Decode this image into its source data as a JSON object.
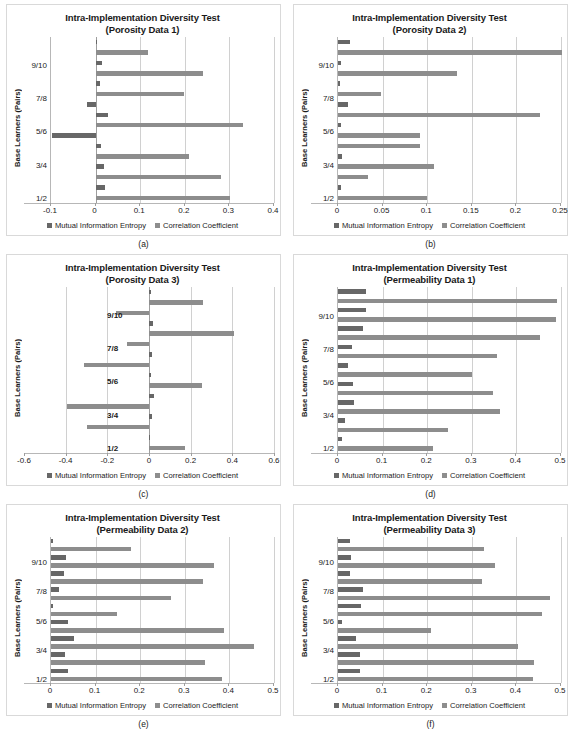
{
  "figure": {
    "legend": {
      "series1_label": "Mutual Information Entropy",
      "series2_label": "Correlation Coefficient",
      "series1_color": "#676767",
      "series2_color": "#8d8d8d"
    },
    "y_axis_title": "Base Learners (Pairs)",
    "captions": [
      "(a)",
      "(b)",
      "(c)",
      "(d)",
      "(e)",
      "(f)"
    ]
  },
  "chart_data": [
    {
      "type": "bar",
      "orientation": "horizontal",
      "panel": "a",
      "caption": "(a)",
      "title": "Intra-Implementation Diversity Test",
      "subtitle": "(Porosity Data 1)",
      "xlabel": "",
      "ylabel": "Base Learners (Pairs)",
      "categories": [
        "1/2",
        "3/4",
        "5/6",
        "7/8",
        "9/10"
      ],
      "category_label_position": "left",
      "xlim": [
        -0.1,
        0.4
      ],
      "xticks": [
        -0.1,
        0,
        0.1,
        0.2,
        0.3,
        0.4
      ],
      "xticklabels": [
        "-0.1",
        "0",
        "0.1",
        "0.2",
        "0.3",
        "0.4"
      ],
      "grid": true,
      "legend_position": "bottom",
      "series": [
        {
          "name": "Mutual Information Entropy",
          "values": [
            0.022,
            0.018,
            0.012,
            0.027,
            -0.1,
            0.008,
            -0.018,
            0.01,
            0.014,
            0.003
          ]
        },
        {
          "name": "Correlation Coefficient",
          "values": [
            0.302,
            0.282,
            0.209,
            0.331,
            0.005,
            0.199,
            0.0,
            0.241,
            0.118,
            0.0
          ]
        }
      ],
      "bars": [
        {
          "category": "1/2",
          "series": "Correlation Coefficient",
          "value": 0.302
        },
        {
          "category": "1/2",
          "series": "Mutual Information Entropy",
          "value": 0.022
        },
        {
          "category": "1/2b",
          "series": "Correlation Coefficient",
          "value": 0.282
        },
        {
          "category": "1/2b",
          "series": "Mutual Information Entropy",
          "value": 0.018
        },
        {
          "category": "3/4",
          "series": "Correlation Coefficient",
          "value": 0.209
        },
        {
          "category": "3/4",
          "series": "Mutual Information Entropy",
          "value": 0.012
        },
        {
          "category": "3/4b",
          "series": "Mutual Information Entropy",
          "value": -0.098
        },
        {
          "category": "5/6",
          "series": "Correlation Coefficient",
          "value": 0.331
        },
        {
          "category": "5/6",
          "series": "Mutual Information Entropy",
          "value": 0.027
        },
        {
          "category": "5/6b",
          "series": "Mutual Information Entropy",
          "value": -0.019
        },
        {
          "category": "7/8",
          "series": "Correlation Coefficient",
          "value": 0.199
        },
        {
          "category": "7/8",
          "series": "Mutual Information Entropy",
          "value": 0.01
        },
        {
          "category": "7/8b",
          "series": "Correlation Coefficient",
          "value": 0.241
        },
        {
          "category": "7/8b",
          "series": "Mutual Information Entropy",
          "value": 0.014
        },
        {
          "category": "9/10",
          "series": "Correlation Coefficient",
          "value": 0.118
        },
        {
          "category": "9/10",
          "series": "Mutual Information Entropy",
          "value": 0.004
        }
      ]
    },
    {
      "type": "bar",
      "orientation": "horizontal",
      "panel": "b",
      "caption": "(b)",
      "title": "Intra-Implementation Diversity Test",
      "subtitle": "(Porosity Data 2)",
      "xlabel": "",
      "ylabel": "Base Learners (Pairs)",
      "categories": [
        "1/2",
        "3/4",
        "5/6",
        "7/8",
        "9/10"
      ],
      "category_label_position": "left",
      "xlim": [
        0,
        0.25
      ],
      "xticks": [
        0,
        0.05,
        0.1,
        0.15,
        0.2,
        0.25
      ],
      "xticklabels": [
        "0",
        "0.05",
        "0.1",
        "0.15",
        "0.2",
        "0.25"
      ],
      "grid": true,
      "legend_position": "bottom",
      "bars": [
        {
          "category": "1/2",
          "series": "Correlation Coefficient",
          "value": 0.1
        },
        {
          "category": "1/2",
          "series": "Mutual Information Entropy",
          "value": 0.003
        },
        {
          "category": "1/2b",
          "series": "Correlation Coefficient",
          "value": 0.034
        },
        {
          "category": "3/4",
          "series": "Correlation Coefficient",
          "value": 0.108
        },
        {
          "category": "3/4",
          "series": "Mutual Information Entropy",
          "value": 0.004
        },
        {
          "category": "3/4b",
          "series": "Correlation Coefficient",
          "value": 0.092
        },
        {
          "category": "5/6",
          "series": "Correlation Coefficient",
          "value": 0.092
        },
        {
          "category": "5/6",
          "series": "Mutual Information Entropy",
          "value": 0.003
        },
        {
          "category": "5/6b",
          "series": "Correlation Coefficient",
          "value": 0.227
        },
        {
          "category": "5/6b",
          "series": "Mutual Information Entropy",
          "value": 0.011
        },
        {
          "category": "7/8",
          "series": "Correlation Coefficient",
          "value": 0.048
        },
        {
          "category": "7/8",
          "series": "Mutual Information Entropy",
          "value": 0.002
        },
        {
          "category": "7/8b",
          "series": "Correlation Coefficient",
          "value": 0.133
        },
        {
          "category": "7/8b",
          "series": "Mutual Information Entropy",
          "value": 0.003
        },
        {
          "category": "9/10",
          "series": "Correlation Coefficient",
          "value": 0.251
        },
        {
          "category": "9/10",
          "series": "Mutual Information Entropy",
          "value": 0.014
        }
      ]
    },
    {
      "type": "bar",
      "orientation": "horizontal",
      "panel": "c",
      "caption": "(c)",
      "title": "Intra-Implementation Diversity Test",
      "subtitle": "(Porosity Data 3)",
      "xlabel": "",
      "ylabel": "Base Learners (Pairs)",
      "categories": [
        "1/2",
        "3/4",
        "5/6",
        "7/8",
        "9/10"
      ],
      "category_label_position": "inside",
      "xlim": [
        -0.6,
        0.6
      ],
      "xticks": [
        -0.6,
        -0.4,
        -0.2,
        0,
        0.2,
        0.4,
        0.6
      ],
      "xticklabels": [
        "-0.6",
        "-0.4",
        "-0.2",
        "0",
        "0.2",
        "0.4",
        "0.6"
      ],
      "grid": true,
      "legend_position": "bottom",
      "bars": [
        {
          "category": "1/2",
          "series": "Correlation Coefficient",
          "value": 0.175
        },
        {
          "category": "1/2",
          "series": "Mutual Information Entropy",
          "value": 0.006
        },
        {
          "category": "1/2b",
          "series": "Correlation Coefficient",
          "value": -0.296
        },
        {
          "category": "1/2b",
          "series": "Mutual Information Entropy",
          "value": 0.012
        },
        {
          "category": "3/4",
          "series": "Correlation Coefficient",
          "value": -0.395
        },
        {
          "category": "3/4",
          "series": "Mutual Information Entropy",
          "value": 0.022
        },
        {
          "category": "3/4b",
          "series": "Correlation Coefficient",
          "value": 0.252
        },
        {
          "category": "3/4b",
          "series": "Mutual Information Entropy",
          "value": 0.01
        },
        {
          "category": "5/6",
          "series": "Correlation Coefficient",
          "value": -0.313
        },
        {
          "category": "5/6",
          "series": "Mutual Information Entropy",
          "value": 0.013
        },
        {
          "category": "5/6b",
          "series": "Correlation Coefficient",
          "value": -0.108
        },
        {
          "category": "7/8",
          "series": "Correlation Coefficient",
          "value": 0.41
        },
        {
          "category": "7/8",
          "series": "Mutual Information Entropy",
          "value": 0.021
        },
        {
          "category": "7/8b",
          "series": "Correlation Coefficient",
          "value": -0.158
        },
        {
          "category": "9/10",
          "series": "Correlation Coefficient",
          "value": 0.258
        },
        {
          "category": "9/10",
          "series": "Mutual Information Entropy",
          "value": 0.008
        }
      ]
    },
    {
      "type": "bar",
      "orientation": "horizontal",
      "panel": "d",
      "caption": "(d)",
      "title": "Intra-Implementation Diversity Test",
      "subtitle": "(Permeability Data 1)",
      "xlabel": "",
      "ylabel": "Base Learners (Pairs)",
      "categories": [
        "1/2",
        "3/4",
        "5/6",
        "7/8",
        "9/10"
      ],
      "category_label_position": "left",
      "xlim": [
        0,
        0.5
      ],
      "xticks": [
        0,
        0.1,
        0.2,
        0.3,
        0.4,
        0.5
      ],
      "xticklabels": [
        "0",
        "0.1",
        "0.2",
        "0.3",
        "0.4",
        "0.5"
      ],
      "grid": true,
      "legend_position": "bottom",
      "bars": [
        {
          "category": "1/2",
          "series": "Correlation Coefficient",
          "value": 0.214
        },
        {
          "category": "1/2",
          "series": "Mutual Information Entropy",
          "value": 0.009
        },
        {
          "category": "1/2b",
          "series": "Correlation Coefficient",
          "value": 0.246
        },
        {
          "category": "1/2b",
          "series": "Mutual Information Entropy",
          "value": 0.016
        },
        {
          "category": "3/4",
          "series": "Correlation Coefficient",
          "value": 0.364
        },
        {
          "category": "3/4",
          "series": "Mutual Information Entropy",
          "value": 0.036
        },
        {
          "category": "3/4b",
          "series": "Correlation Coefficient",
          "value": 0.347
        },
        {
          "category": "3/4b",
          "series": "Mutual Information Entropy",
          "value": 0.033
        },
        {
          "category": "5/6",
          "series": "Correlation Coefficient",
          "value": 0.301
        },
        {
          "category": "5/6",
          "series": "Mutual Information Entropy",
          "value": 0.023
        },
        {
          "category": "5/6b",
          "series": "Correlation Coefficient",
          "value": 0.356
        },
        {
          "category": "5/6b",
          "series": "Mutual Information Entropy",
          "value": 0.031
        },
        {
          "category": "7/8",
          "series": "Correlation Coefficient",
          "value": 0.454
        },
        {
          "category": "7/8",
          "series": "Mutual Information Entropy",
          "value": 0.055
        },
        {
          "category": "7/8b",
          "series": "Correlation Coefficient",
          "value": 0.488
        },
        {
          "category": "7/8b",
          "series": "Mutual Information Entropy",
          "value": 0.062
        },
        {
          "category": "9/10",
          "series": "Correlation Coefficient",
          "value": 0.492
        },
        {
          "category": "9/10",
          "series": "Mutual Information Entropy",
          "value": 0.062
        }
      ]
    },
    {
      "type": "bar",
      "orientation": "horizontal",
      "panel": "e",
      "caption": "(e)",
      "title": "Intra-Implementation Diversity Test",
      "subtitle": "(Permeability Data 2)",
      "xlabel": "",
      "ylabel": "Base Learners (Pairs)",
      "categories": [
        "1/2",
        "3/4",
        "5/6",
        "7/8",
        "9/10"
      ],
      "category_label_position": "left",
      "xlim": [
        0,
        0.5
      ],
      "xticks": [
        0,
        0.1,
        0.2,
        0.3,
        0.4,
        0.5
      ],
      "xticklabels": [
        "0",
        "0.1",
        "0.2",
        "0.3",
        "0.4",
        "0.5"
      ],
      "grid": true,
      "legend_position": "bottom",
      "bars": [
        {
          "category": "1/2",
          "series": "Correlation Coefficient",
          "value": 0.383
        },
        {
          "category": "1/2",
          "series": "Mutual Information Entropy",
          "value": 0.038
        },
        {
          "category": "1/2b",
          "series": "Correlation Coefficient",
          "value": 0.345
        },
        {
          "category": "1/2b",
          "series": "Mutual Information Entropy",
          "value": 0.031
        },
        {
          "category": "3/4",
          "series": "Correlation Coefficient",
          "value": 0.455
        },
        {
          "category": "3/4",
          "series": "Mutual Information Entropy",
          "value": 0.052
        },
        {
          "category": "3/4b",
          "series": "Correlation Coefficient",
          "value": 0.388
        },
        {
          "category": "3/4b",
          "series": "Mutual Information Entropy",
          "value": 0.038
        },
        {
          "category": "5/6",
          "series": "Correlation Coefficient",
          "value": 0.148
        },
        {
          "category": "5/6",
          "series": "Mutual Information Entropy",
          "value": 0.005
        },
        {
          "category": "5/6b",
          "series": "Correlation Coefficient",
          "value": 0.269
        },
        {
          "category": "5/6b",
          "series": "Mutual Information Entropy",
          "value": 0.019
        },
        {
          "category": "7/8",
          "series": "Correlation Coefficient",
          "value": 0.341
        },
        {
          "category": "7/8",
          "series": "Mutual Information Entropy",
          "value": 0.029
        },
        {
          "category": "7/8b",
          "series": "Correlation Coefficient",
          "value": 0.366
        },
        {
          "category": "7/8b",
          "series": "Mutual Information Entropy",
          "value": 0.034
        },
        {
          "category": "9/10",
          "series": "Correlation Coefficient",
          "value": 0.179
        },
        {
          "category": "9/10",
          "series": "Mutual Information Entropy",
          "value": 0.005
        }
      ]
    },
    {
      "type": "bar",
      "orientation": "horizontal",
      "panel": "f",
      "caption": "(f)",
      "title": "Intra-Implementation Diversity Test",
      "subtitle": "(Permeability Data 3)",
      "xlabel": "",
      "ylabel": "Base Learners (Pairs)",
      "categories": [
        "1/2",
        "3/4",
        "5/6",
        "7/8",
        "9/10"
      ],
      "category_label_position": "left",
      "xlim": [
        0,
        0.5
      ],
      "xticks": [
        0,
        0.1,
        0.2,
        0.3,
        0.4,
        0.5
      ],
      "xticklabels": [
        "0",
        "0.1",
        "0.2",
        "0.3",
        "0.4",
        "0.5"
      ],
      "grid": true,
      "legend_position": "bottom",
      "bars": [
        {
          "category": "1/2",
          "series": "Correlation Coefficient",
          "value": 0.438
        },
        {
          "category": "1/2",
          "series": "Mutual Information Entropy",
          "value": 0.049
        },
        {
          "category": "1/2b",
          "series": "Correlation Coefficient",
          "value": 0.439
        },
        {
          "category": "1/2b",
          "series": "Mutual Information Entropy",
          "value": 0.049
        },
        {
          "category": "3/4",
          "series": "Correlation Coefficient",
          "value": 0.403
        },
        {
          "category": "3/4",
          "series": "Mutual Information Entropy",
          "value": 0.04
        },
        {
          "category": "3/4b",
          "series": "Correlation Coefficient",
          "value": 0.209
        },
        {
          "category": "3/4b",
          "series": "Mutual Information Entropy",
          "value": 0.01
        },
        {
          "category": "5/6",
          "series": "Correlation Coefficient",
          "value": 0.457
        },
        {
          "category": "5/6",
          "series": "Mutual Information Entropy",
          "value": 0.052
        },
        {
          "category": "5/6b",
          "series": "Correlation Coefficient",
          "value": 0.476
        },
        {
          "category": "5/6b",
          "series": "Mutual Information Entropy",
          "value": 0.057
        },
        {
          "category": "7/8",
          "series": "Correlation Coefficient",
          "value": 0.322
        },
        {
          "category": "7/8",
          "series": "Mutual Information Entropy",
          "value": 0.027
        },
        {
          "category": "7/8b",
          "series": "Correlation Coefficient",
          "value": 0.352
        },
        {
          "category": "7/8b",
          "series": "Mutual Information Entropy",
          "value": 0.03
        },
        {
          "category": "9/10",
          "series": "Correlation Coefficient",
          "value": 0.327
        },
        {
          "category": "9/10",
          "series": "Mutual Information Entropy",
          "value": 0.026
        }
      ]
    }
  ]
}
